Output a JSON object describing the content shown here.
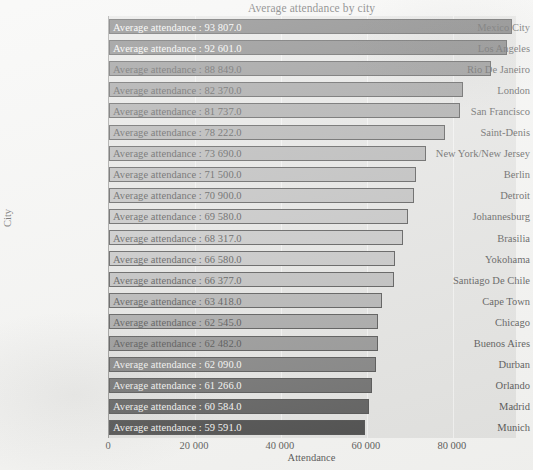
{
  "chart_data": {
    "type": "bar",
    "orientation": "horizontal",
    "title": "Average attendance by city",
    "xlabel": "Attendance",
    "ylabel": "City",
    "xlim": [
      0,
      94700
    ],
    "xticks": [
      0,
      20000,
      40000,
      60000,
      80000
    ],
    "xtick_labels": [
      "0",
      "20 000",
      "40 000",
      "60 000",
      "80 000"
    ],
    "grid": true,
    "legend": "none",
    "label_prefix": "Average attendance : ",
    "categories": [
      "Mexico City",
      "Los Angeles",
      "Rio De Janeiro",
      "London",
      "San Francisco",
      "Saint-Denis",
      "New York/New Jersey",
      "Berlin",
      "Detroit",
      "Johannesburg",
      "Brasilia",
      "Yokohama",
      "Santiago De Chile",
      "Cape Town",
      "Chicago",
      "Buenos Aires",
      "Durban",
      "Orlando",
      "Madrid",
      "Munich"
    ],
    "values": [
      93807.0,
      92601.0,
      88849.0,
      82370.0,
      81737.0,
      78222.0,
      73690.0,
      71500.0,
      70900.0,
      69580.0,
      68317.0,
      66580.0,
      66377.0,
      63418.0,
      62545.0,
      62482.0,
      62090.0,
      61266.0,
      60584.0,
      59591.0
    ],
    "value_labels": [
      "Average attendance : 93 807.0",
      "Average attendance : 92 601.0",
      "Average attendance : 88 849.0",
      "Average attendance : 82 370.0",
      "Average attendance : 81 737.0",
      "Average attendance : 78 222.0",
      "Average attendance : 73 690.0",
      "Average attendance : 71 500.0",
      "Average attendance : 70 900.0",
      "Average attendance : 69 580.0",
      "Average attendance : 68 317.0",
      "Average attendance : 66 580.0",
      "Average attendance : 66 377.0",
      "Average attendance : 63 418.0",
      "Average attendance : 62 545.0",
      "Average attendance : 62 482.0",
      "Average attendance : 62 090.0",
      "Average attendance : 61 266.0",
      "Average attendance : 60 584.0",
      "Average attendance : 59 591.0"
    ],
    "bar_colors": [
      "#4b4b4b",
      "#545454",
      "#6b6b6b",
      "#7d7d7d",
      "#8a8a8a",
      "#949494",
      "#9c9c9c",
      "#a4a4a4",
      "#aaaaaa",
      "#b0b0b0",
      "#b4b4b4",
      "#b2b2b2",
      "#a8a8a8",
      "#9a9a9a",
      "#8a8a8a",
      "#737373",
      "#5a5a5a",
      "#414141",
      "#2c2c2c",
      "#161616"
    ],
    "label_text_shade": [
      "light",
      "light",
      "dark",
      "dark",
      "dark",
      "dark",
      "dark",
      "dark",
      "dark",
      "dark",
      "dark",
      "dark",
      "dark",
      "dark",
      "dark",
      "dark",
      "light",
      "light",
      "light",
      "light"
    ]
  },
  "plot": {
    "background_color": "#dcdcda",
    "page_background_color": "#f2f2f0",
    "axis_color": "#7a7a78",
    "gridline_color": "#ffffff",
    "bar_outline_color": "#1c1c1c"
  }
}
